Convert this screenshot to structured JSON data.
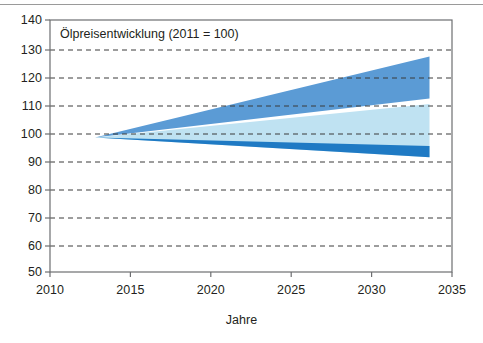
{
  "figure": {
    "title": "Ölpreisentwicklung (2011 = 100)",
    "x_axis_title": "Jahre",
    "top_rule": true
  },
  "colors": {
    "band_outer": "#5b9bd5",
    "band_inner": "#bfe2f2",
    "band_lower": "#1f7ac4",
    "axis": "#6d6e71",
    "grid": "#3a3a3a",
    "text": "#231f20",
    "background": "#ffffff"
  },
  "chart_data": {
    "type": "area",
    "title": "Ölpreisentwicklung (2011 = 100)",
    "xlabel": "Jahre",
    "ylabel": "",
    "xlim": [
      2010,
      2035
    ],
    "ylim": [
      50,
      140
    ],
    "xticks": [
      2010,
      2015,
      2020,
      2025,
      2030,
      2035
    ],
    "yticks": [
      50,
      60,
      70,
      80,
      90,
      100,
      110,
      120,
      130,
      140
    ],
    "grid": "horizontal-dashed",
    "legend": "none",
    "index_base_year": 2011,
    "index_base_value": 100,
    "fan_apex": {
      "x": 2012.8,
      "y": 98
    },
    "fan_end_x": 2033.6,
    "series": [
      {
        "name": "Oberes Band (obere Grenze)",
        "color": "#5b9bd5",
        "x": [
          2012.8,
          2033.6
        ],
        "values": [
          98,
          127
        ]
      },
      {
        "name": "Oberes Band (untere Grenze)",
        "color": "#5b9bd5",
        "x": [
          2012.8,
          2033.6
        ],
        "values": [
          98,
          112
        ]
      },
      {
        "name": "Inneres Band (obere Grenze)",
        "color": "#bfe2f2",
        "x": [
          2012.8,
          2033.6
        ],
        "values": [
          98,
          110
        ]
      },
      {
        "name": "Inneres Band (untere Grenze)",
        "color": "#bfe2f2",
        "x": [
          2012.8,
          2033.6
        ],
        "values": [
          98,
          91
        ]
      },
      {
        "name": "Unteres Band (obere Grenze)",
        "color": "#1f7ac4",
        "x": [
          2012.8,
          2033.6
        ],
        "values": [
          98,
          95
        ]
      },
      {
        "name": "Unteres Band (untere Grenze)",
        "color": "#1f7ac4",
        "x": [
          2012.8,
          2033.6
        ],
        "values": [
          98,
          91
        ]
      }
    ]
  },
  "y_ticks": [
    {
      "label": "140"
    },
    {
      "label": "130"
    },
    {
      "label": "120"
    },
    {
      "label": "110"
    },
    {
      "label": "100"
    },
    {
      "label": "90"
    },
    {
      "label": "80"
    },
    {
      "label": "70"
    },
    {
      "label": "60"
    },
    {
      "label": "50"
    }
  ],
  "x_ticks": [
    {
      "label": "2010"
    },
    {
      "label": "2015"
    },
    {
      "label": "2020"
    },
    {
      "label": "2025"
    },
    {
      "label": "2030"
    },
    {
      "label": "2035"
    }
  ]
}
